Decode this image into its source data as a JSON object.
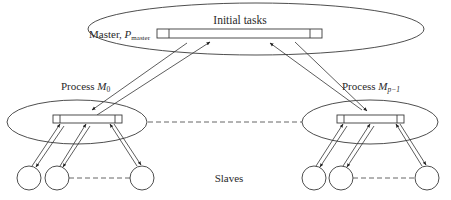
{
  "diagram": {
    "type": "master-slave hierarchy",
    "master": {
      "label_prefix": "Master, ",
      "label_symbol": "P",
      "label_subscript": "master",
      "queue_label": "Initial tasks"
    },
    "processes": [
      {
        "label_prefix": "Process ",
        "label_symbol": "M",
        "label_subscript": "0"
      },
      {
        "label_prefix": "Process ",
        "label_symbol": "M",
        "label_subscript": "p−1"
      }
    ],
    "slaves_label": "Slaves",
    "edges": [
      {
        "from": "master",
        "to": "process-M0",
        "style": "double-arrow"
      },
      {
        "from": "master",
        "to": "process-Mp-1",
        "style": "double-arrow"
      },
      {
        "from": "process-M0",
        "to": "process-Mp-1",
        "style": "dashed"
      },
      {
        "from": "process-M0",
        "to": "slave-left-1",
        "style": "double-arrow"
      },
      {
        "from": "process-M0",
        "to": "slave-left-2",
        "style": "double-arrow"
      },
      {
        "from": "process-M0",
        "to": "slave-left-n",
        "style": "double-arrow"
      },
      {
        "from": "process-Mp-1",
        "to": "slave-right-1",
        "style": "double-arrow"
      },
      {
        "from": "process-Mp-1",
        "to": "slave-right-2",
        "style": "double-arrow"
      },
      {
        "from": "process-Mp-1",
        "to": "slave-right-n",
        "style": "double-arrow"
      }
    ],
    "colors": {
      "stroke": "#3a3a3a",
      "text": "#2a2a2a",
      "background": "#ffffff"
    }
  }
}
